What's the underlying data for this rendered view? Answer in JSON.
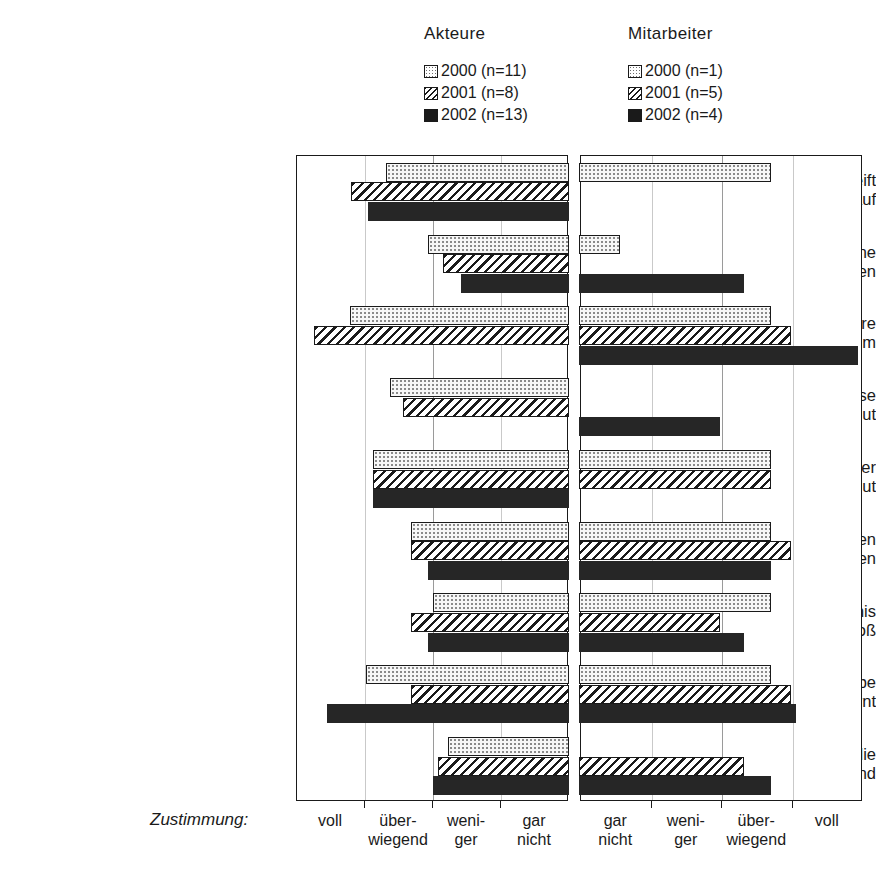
{
  "legend": {
    "left": {
      "title": "Akteure",
      "entries": [
        {
          "label": "2000 (n=11)",
          "year": "2000",
          "n": 11,
          "swatch": "dotted-square-icon"
        },
        {
          "label": "2001 (n=8)",
          "year": "2001",
          "n": 8,
          "swatch": "hatched-square-icon"
        },
        {
          "label": "2002 (n=13)",
          "year": "2002",
          "n": 13,
          "swatch": "filled-square-icon"
        }
      ]
    },
    "right": {
      "title": "Mitarbeiter",
      "entries": [
        {
          "label": "2000 (n=1)",
          "year": "2000",
          "n": 1,
          "swatch": "dotted-square-icon"
        },
        {
          "label": "2001 (n=5)",
          "year": "2001",
          "n": 5,
          "swatch": "hatched-square-icon"
        },
        {
          "label": "2002 (n=4)",
          "year": "2002",
          "n": 4,
          "swatch": "filled-square-icon"
        }
      ]
    }
  },
  "axis": {
    "caption": "Zustimmung:",
    "left_ticks": [
      "voll",
      "über-\nwiegend",
      "weni-\nger",
      "gar\nnicht"
    ],
    "right_ticks": [
      "gar\nnicht",
      "weni-\nger",
      "über-\nwiegend",
      "voll"
    ]
  },
  "chart_data": {
    "type": "bar",
    "title": "",
    "orientation": "horizontal",
    "layout": "mirrored-dual-panel",
    "xlabel": "Zustimmung:",
    "ylabel": "",
    "grid": true,
    "legend_position": "top",
    "scale_note": "Each panel spans 4 ordinal agreement steps. Left panel (Akteure) runs voll (outer left) to gar nicht (inner right); bars are anchored at the inner edge and grow leftward, so a longer bar means stronger agreement. Right panel (Mitarbeiter) runs gar nicht (inner left) to voll (outer right); bars are anchored at the inner edge and grow rightward, so a longer bar means stronger agreement.",
    "categories": [
      "Teilprojekt greift\ndrängende Fragen auf",
      "Es fehlen keine\nwichtigen Personen",
      "Die Arbeitsatmosphäre\nist angenehm",
      "Die Art und Weise\ndes Vorgehens ist gut",
      "Der Beitrag der\nProjektgruppe ist gut",
      "Mit den erzielten\nErgebnissen zufrieden",
      "Aufwand im Verhältnis\nzum Ertrag zu groß",
      "Ich habe\nNeues dazugelernt",
      "Ergebnisse haben die\nnächsten 10 Jahre bestand"
    ],
    "scale_min": 0,
    "scale_max": 4,
    "panels": [
      {
        "name": "Akteure",
        "direction": "leftward",
        "tick_labels": [
          "voll",
          "über-\nwiegend",
          "weni-\nger",
          "gar\nnicht"
        ],
        "series": [
          {
            "name": "2000 (n=11)",
            "year": "2000",
            "fill": "dotted",
            "values": [
              2.68,
              2.07,
              3.22,
              2.62,
              2.88,
              2.32,
              2.0,
              2.98,
              1.78
            ]
          },
          {
            "name": "2001 (n=8)",
            "year": "2001",
            "fill": "hatched",
            "values": [
              3.2,
              1.85,
              3.75,
              2.43,
              2.88,
              2.32,
              2.32,
              2.32,
              1.92
            ]
          },
          {
            "name": "2002 (n=13)",
            "year": "2002",
            "fill": "solid",
            "values": [
              2.95,
              1.58,
              0.0,
              0.0,
              2.88,
              2.07,
              2.07,
              3.55,
              2.0
            ]
          }
        ]
      },
      {
        "name": "Mitarbeiter",
        "direction": "rightward",
        "tick_labels": [
          "gar\nnicht",
          "weni-\nger",
          "über-\nwiegend",
          "voll"
        ],
        "series": [
          {
            "name": "2000 (n=1)",
            "year": "2000",
            "fill": "dotted",
            "values": [
              2.72,
              0.58,
              2.72,
              0.0,
              2.72,
              2.72,
              2.72,
              2.72,
              0.0
            ]
          },
          {
            "name": "2001 (n=5)",
            "year": "2001",
            "fill": "hatched",
            "values": [
              0.0,
              0.0,
              3.0,
              0.0,
              2.72,
              3.0,
              2.0,
              3.0,
              2.33
            ]
          },
          {
            "name": "2002 (n=4)",
            "year": "2002",
            "fill": "solid",
            "values": [
              0.0,
              2.33,
              3.95,
              2.0,
              0.0,
              2.72,
              2.33,
              3.07,
              2.72
            ]
          }
        ]
      }
    ]
  }
}
